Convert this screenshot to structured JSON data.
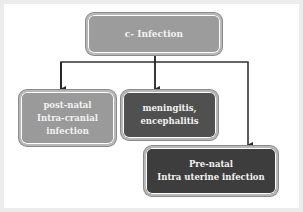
{
  "diagram": {
    "root": {
      "label": "c- Infection"
    },
    "children": [
      {
        "lines": [
          "post-natal",
          "Intra-cranial",
          "infection"
        ]
      },
      {
        "lines": [
          "meningitis,",
          "encephalitis"
        ]
      },
      {
        "lines": [
          "Pre-natal",
          "Intra uterine infection"
        ]
      }
    ],
    "colors": {
      "root_fill": "#9c9c9c",
      "postnatal_fill": "#9a9a9a",
      "meningitis_fill": "#505050",
      "prenatal_fill": "#3d3d3d",
      "connector": "#333333",
      "text": "#f2f2f2"
    }
  }
}
